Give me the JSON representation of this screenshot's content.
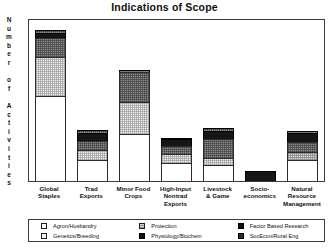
{
  "chart_data": {
    "type": "bar",
    "subtype": "stacked-bar",
    "title": "Indications of Scope",
    "xlabel": "",
    "ylabel": "Number of Activities",
    "ylabel_letters": [
      "N",
      "u",
      "m",
      "b",
      "e",
      "r",
      "",
      "o",
      "f",
      "",
      "A",
      "c",
      "t",
      "i",
      "v",
      "i",
      "t",
      "i",
      "e",
      "s"
    ],
    "grid": false,
    "axis_ticks_shown": false,
    "ylim": [
      0,
      100
    ],
    "legend_position": "bottom",
    "categories": [
      "Global Staples",
      "Trad Exports",
      "Minor Food Crops",
      "High-Input Nontrad Exports",
      "Livestock & Game",
      "Socio-economics",
      "Natural Resource Management"
    ],
    "category_lines": [
      [
        "Global",
        "Staples"
      ],
      [
        "Trad",
        "Exports"
      ],
      [
        "Minor Food",
        "Crops"
      ],
      [
        "High-Input",
        "Nontrad",
        "Exports"
      ],
      [
        "Livestock",
        "& Game"
      ],
      [
        "Socio-",
        "economics"
      ],
      [
        "Natural",
        "Resource",
        "Management"
      ]
    ],
    "series": [
      {
        "name": "Agron/Husbandry",
        "key": "agron",
        "swatch": "f-agron",
        "values": [
          53,
          13,
          29,
          11,
          10,
          0,
          13
        ]
      },
      {
        "name": "Genetics/Breeding",
        "key": "genetics",
        "swatch": "f-genetics",
        "values": [
          24,
          6,
          20,
          6,
          4,
          0,
          0
        ]
      },
      {
        "name": "Protection",
        "key": "protection",
        "swatch": "f-protection",
        "values": [
          0,
          0,
          0,
          0,
          0,
          0,
          5
        ]
      },
      {
        "name": "Physiology/Biochem",
        "key": "physio",
        "swatch": "f-physio",
        "values": [
          12,
          6,
          19,
          5,
          12,
          0,
          6
        ]
      },
      {
        "name": "Factor Based Research",
        "key": "factor",
        "swatch": "f-factor",
        "values": [
          3,
          5,
          0,
          4,
          5,
          6,
          6
        ]
      },
      {
        "name": "SocEcon/Rural Eng",
        "key": "socecon",
        "swatch": "f-socecon",
        "values": [
          2,
          2,
          1,
          1,
          2,
          0,
          1
        ]
      }
    ],
    "totals": [
      94,
      32,
      69,
      27,
      33,
      6,
      31
    ],
    "legend_entries": [
      {
        "label": "Agron/Husbandry",
        "swatch": "s-agron"
      },
      {
        "label": "Genetics/Breeding",
        "swatch": "s-genetics"
      },
      {
        "label": "Protection",
        "swatch": "s-protection"
      },
      {
        "label": "Physiology/Biochem",
        "swatch": "s-physio"
      },
      {
        "label": "Factor Based Research",
        "swatch": "s-factor"
      },
      {
        "label": "SocEcon/Rural Eng",
        "swatch": "s-socecon"
      }
    ],
    "colors": {
      "agron": "#ffffff",
      "genetics": "#f0f0f0",
      "protection": "#d9d9d9",
      "physio": "#8f8f8f",
      "factor": "#151515",
      "socecon": "#333333",
      "axis": "#3a3a3a",
      "text": "#111111",
      "background": "#ffffff"
    }
  }
}
